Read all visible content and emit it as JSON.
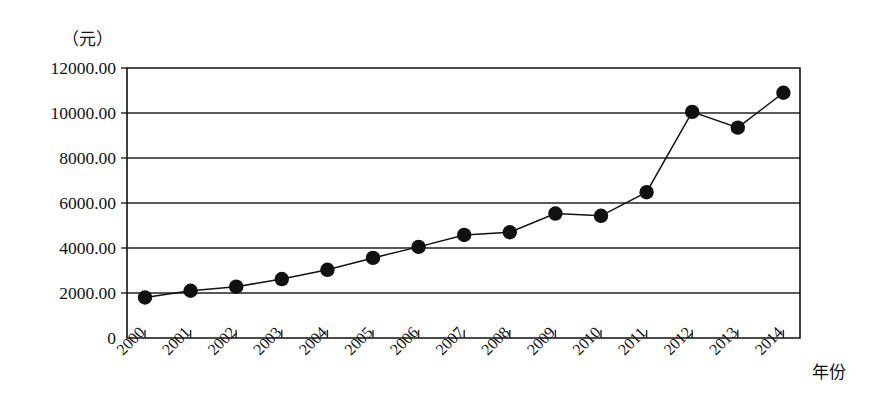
{
  "chart_data": {
    "type": "line",
    "title": "",
    "subtitle": "",
    "xlabel": "年份",
    "ylabel": "（元）",
    "unit_label": "（元）",
    "categories": [
      "2000",
      "2001",
      "2002",
      "2003",
      "2004",
      "2005",
      "2006",
      "2007",
      "2008",
      "2009",
      "2010",
      "2011",
      "2012",
      "2013",
      "2014"
    ],
    "values": [
      1800,
      2100,
      2280,
      2620,
      3030,
      3560,
      4050,
      4580,
      4700,
      5530,
      5430,
      6480,
      10050,
      9350,
      10900
    ],
    "series": [
      {
        "name": "",
        "values": [
          1800,
          2100,
          2280,
          2620,
          3030,
          3560,
          4050,
          4580,
          4700,
          5530,
          5430,
          6480,
          10050,
          9350,
          10900
        ]
      }
    ],
    "ylim": [
      0,
      12000
    ],
    "yticks": [
      0,
      2000,
      4000,
      6000,
      8000,
      10000,
      12000
    ],
    "ytick_labels": [
      "0",
      "2000.00",
      "4000.00",
      "6000.00",
      "8000.00",
      "10000.00",
      "12000.00"
    ],
    "xtick_labels": [
      "2000",
      "2001",
      "2002",
      "2003",
      "2004",
      "2005",
      "2006",
      "2007",
      "2008",
      "2009",
      "2010",
      "2011",
      "2012",
      "2013",
      "2014"
    ],
    "grid": true,
    "grid_axis": "y",
    "legend": false,
    "legend_position": "none",
    "marker": "filled-circle",
    "line_color": "#111111",
    "marker_color": "#111111",
    "background_color": "#ffffff",
    "xtick_label_rotation": -45,
    "annotations": []
  },
  "axis": {
    "x_name": "年份",
    "y_unit": "（元）"
  }
}
